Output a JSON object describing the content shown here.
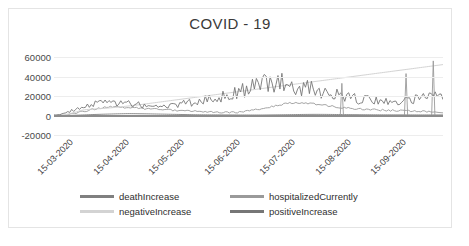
{
  "chart_data": {
    "type": "line",
    "title": "COVID - 19",
    "xlabel": "",
    "ylabel": "",
    "ylim": [
      -20000,
      60000
    ],
    "yticks": [
      "60000",
      "40000",
      "20000",
      "0",
      "-20000"
    ],
    "grid": true,
    "legend_position": "bottom",
    "x_tick_labels": [
      "15-03-2020",
      "15-04-2020",
      "15-05-2020",
      "15-06-2020",
      "15-07-2020",
      "15-08-2020",
      "15-09-2020"
    ],
    "x_axis_start": "15-03-2020",
    "x_axis_end": "30-09-2020",
    "series": [
      {
        "name": "deathIncrease",
        "color": "#808080",
        "values": [
          20,
          25,
          30,
          40,
          55,
          70,
          90,
          120,
          160,
          210,
          270,
          340,
          420,
          500,
          580,
          660,
          740,
          820,
          900,
          980,
          1050,
          1120,
          1180,
          1240,
          1300,
          1360,
          1420,
          1480,
          1540,
          1600,
          1650,
          1700,
          1750,
          1800,
          1840,
          1880,
          1900,
          1920,
          1900,
          1880,
          1850,
          1820,
          1790,
          1760,
          1730,
          1700,
          1670,
          1640,
          1600,
          1560,
          1520,
          1480,
          1440,
          1400,
          1360,
          1320,
          1280,
          1240,
          1200,
          1160,
          1120,
          1080,
          1040,
          1000,
          960,
          930,
          900,
          870,
          840,
          810,
          780,
          760,
          740,
          720,
          700,
          690,
          680,
          670,
          660,
          650,
          640,
          630,
          620,
          610,
          600,
          590,
          580,
          570,
          560,
          550,
          545,
          540,
          535,
          530,
          525,
          520,
          515,
          510,
          505,
          500,
          500,
          505,
          515,
          530,
          550,
          575,
          600,
          630,
          660,
          690,
          720,
          750,
          780,
          810,
          840,
          870,
          900,
          930,
          960,
          990,
          1020,
          1050,
          1080,
          1100,
          1120,
          1140,
          1150,
          1160,
          1160,
          1155,
          1150,
          1140,
          1130,
          1120,
          1100,
          1080,
          1060,
          1040,
          1020,
          1000,
          980,
          960,
          940,
          920,
          900,
          880,
          860,
          840,
          820,
          800,
          790,
          780,
          770,
          760,
          750,
          740,
          730,
          720,
          710,
          700,
          695,
          690,
          685,
          680,
          675,
          670,
          665,
          660,
          655,
          650,
          645,
          640,
          635,
          630,
          625,
          620,
          615,
          610,
          605,
          600,
          600,
          600,
          600,
          600,
          600,
          600,
          600,
          600,
          600,
          600,
          600
        ]
      },
      {
        "name": "hospitalizedCurrently",
        "color": "#9a9a9a",
        "values": [
          500,
          700,
          1000,
          1400,
          2000,
          2800,
          3800,
          5000,
          6500,
          8200,
          10000,
          12000,
          14000,
          16000,
          18000,
          20000,
          22000,
          24000,
          26000,
          28000,
          30000,
          32000,
          34000,
          35500,
          37000,
          38500,
          39500,
          40000,
          40200,
          40000,
          39500,
          39000,
          38500,
          38000,
          37500,
          37000,
          36500,
          36000,
          35500,
          35000,
          34500,
          34000,
          33500,
          33000,
          32500,
          32000,
          31500,
          31000,
          30500,
          30000,
          29500,
          29000,
          28500,
          28000,
          27500,
          27000,
          26500,
          26000,
          25500,
          25000,
          24500,
          24000,
          23500,
          23000,
          22500,
          22000,
          21500,
          21000,
          20500,
          20000,
          19500,
          19000,
          18500,
          18000,
          17500,
          17000,
          16500,
          16000,
          15500,
          15000,
          14500,
          14200,
          14000,
          13800,
          13600,
          13500,
          13400,
          13400,
          13500,
          13800,
          14200,
          14800,
          15500,
          16400,
          17400,
          18500,
          19800,
          21200,
          22800,
          24500,
          26500,
          28500,
          30500,
          32500,
          34500,
          36500,
          38500,
          40500,
          42500,
          44500,
          46500,
          48500,
          50000,
          51500,
          53000,
          54500,
          55800,
          57000,
          58000,
          58800,
          59200,
          59400,
          59200,
          58800,
          58200,
          57500,
          56600,
          55600,
          54500,
          53400,
          52200,
          51000,
          49800,
          48600,
          47400,
          46200,
          45000,
          43800,
          42600,
          41400,
          40200,
          39000,
          38000,
          37000,
          36000,
          35200,
          34400,
          33600,
          32800,
          32000,
          31400,
          30800,
          30200,
          29600,
          29000,
          28500,
          28000,
          27500,
          27000,
          26600,
          26200,
          25800,
          25400,
          25000,
          24700,
          24400,
          24100,
          23800,
          23500,
          23200,
          22900,
          22600,
          22300,
          22000,
          21700,
          21400,
          21100,
          20800,
          20500,
          20200,
          19900,
          19600,
          19300,
          19000,
          18700,
          18400,
          18100,
          17800,
          17500,
          17200,
          16900,
          16600,
          16300,
          16000
        ]
      },
      {
        "name": "negativeIncrease",
        "color": "#d3d3d3",
        "values": [
          1000,
          2000,
          4000,
          7000,
          11000,
          16000,
          22000,
          29000,
          37000,
          46000,
          56000,
          67000,
          79000,
          92000,
          100000,
          105000,
          110000,
          112000,
          115000,
          118000,
          120000,
          122000,
          125000,
          128000,
          130000,
          133000,
          136000,
          140000,
          143000,
          147000,
          150000,
          154000,
          158000,
          162000,
          166000,
          170000,
          174000,
          178000,
          182000,
          186000,
          190000,
          195000,
          200000,
          205000,
          210000,
          215000,
          220000,
          225000,
          230000,
          235000,
          240000,
          245000,
          250000,
          255000,
          260000,
          265000,
          270000,
          275000,
          280000,
          285000,
          290000,
          295000,
          300000,
          305000,
          310000,
          315000,
          320000,
          325000,
          330000,
          335000,
          340000,
          345000,
          350000,
          355000,
          360000,
          365000,
          370000,
          375000,
          380000,
          385000,
          390000,
          395000,
          400000,
          405000,
          410000,
          415000,
          420000,
          425000,
          430000,
          435000,
          440000,
          445000,
          450000,
          455000,
          460000,
          465000,
          470000,
          475000,
          480000,
          485000,
          490000,
          495000,
          500000,
          505000,
          510000,
          515000,
          520000,
          525000,
          530000,
          535000,
          540000,
          545000,
          550000,
          555000,
          560000,
          565000,
          570000,
          575000,
          580000,
          585000,
          590000,
          595000,
          600000,
          605000,
          610000,
          615000,
          620000,
          625000,
          630000,
          635000,
          640000,
          645000,
          650000,
          655000,
          660000,
          665000,
          670000,
          675000,
          680000,
          685000,
          690000,
          695000,
          700000,
          705000,
          710000,
          715000,
          720000,
          725000,
          730000,
          735000,
          740000,
          745000,
          750000,
          755000,
          760000,
          765000,
          770000,
          775000,
          780000,
          785000,
          790000,
          795000,
          800000,
          805000,
          810000,
          815000,
          820000,
          825000,
          830000,
          835000,
          840000,
          845000,
          850000,
          855000,
          860000,
          865000,
          870000,
          875000,
          880000,
          885000,
          890000,
          895000,
          900000,
          905000,
          910000,
          915000,
          920000,
          925000,
          930000,
          935000,
          940000
        ]
      },
      {
        "name": "positiveIncrease",
        "color": "#767676",
        "values": [
          800,
          1200,
          1800,
          2600,
          3600,
          4800,
          6200,
          7800,
          9500,
          11000,
          12500,
          14000,
          15500,
          17000,
          18500,
          20000,
          21500,
          23000,
          24500,
          26000,
          27500,
          28500,
          29000,
          29500,
          30000,
          30500,
          31000,
          31500,
          32000,
          31500,
          31000,
          30500,
          30000,
          29500,
          29000,
          28500,
          28000,
          27500,
          27000,
          26500,
          26000,
          25500,
          25000,
          24500,
          24000,
          23500,
          23000,
          22500,
          22000,
          21500,
          21000,
          20500,
          20000,
          20500,
          21000,
          21500,
          22000,
          22500,
          23000,
          23500,
          24000,
          24500,
          25000,
          25500,
          26000,
          26500,
          27000,
          27500,
          28000,
          28500,
          29000,
          29500,
          30000,
          31000,
          32000,
          33000,
          34000,
          35000,
          36000,
          37000,
          38000,
          39000,
          40000,
          41000,
          42000,
          43000,
          44000,
          45000,
          46000,
          47000,
          48000,
          49000,
          50000,
          52000,
          54000,
          56000,
          58000,
          60000,
          62000,
          64000,
          66000,
          67000,
          68000,
          69000,
          70000,
          71000,
          72000,
          73000,
          74000,
          75000,
          76000,
          77000,
          78000,
          79000,
          78000,
          77000,
          76000,
          75000,
          74000,
          73000,
          72000,
          71000,
          70000,
          69000,
          68000,
          67000,
          66000,
          65000,
          64000,
          63000,
          62000,
          61000,
          60000,
          59000,
          58000,
          57000,
          56000,
          55000,
          54000,
          53000,
          52000,
          51000,
          50000,
          49000,
          48000,
          47000,
          46000,
          45000,
          44000,
          43000,
          42000,
          41000,
          40000,
          39000,
          38000,
          37500,
          37000,
          36500,
          36000,
          35500,
          35000,
          34500,
          34000,
          33500,
          33000,
          32500,
          32000,
          31500,
          31000,
          30500,
          30000,
          30500,
          31000,
          31500,
          32000,
          32500,
          33000,
          33500,
          34000,
          34500,
          35000,
          35500,
          36000,
          36500,
          37000,
          37500,
          38000,
          38500,
          39000,
          39500,
          40000,
          40500,
          41000,
          41500,
          42000,
          42500,
          43000,
          43500,
          44000
        ]
      }
    ],
    "notable_peaks": [
      {
        "approx_date": "late-07-2020",
        "value": 33000
      },
      {
        "approx_date": "mid-09-2020",
        "value": 43000
      },
      {
        "approx_date": "late-09-2020",
        "value": 56000
      }
    ]
  },
  "legend": {
    "items": [
      {
        "label": "deathIncrease",
        "color": "#808080"
      },
      {
        "label": "hospitalizedCurrently",
        "color": "#9a9a9a"
      },
      {
        "label": "negativeIncrease",
        "color": "#d3d3d3"
      },
      {
        "label": "positiveIncrease",
        "color": "#767676"
      }
    ]
  },
  "caption": {
    "text": ""
  }
}
